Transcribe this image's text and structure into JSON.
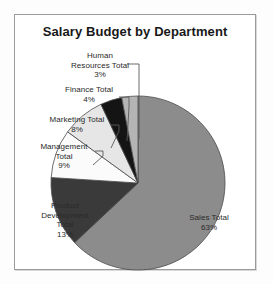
{
  "chart": {
    "title": "Salary Budget by Department",
    "frame_border_color": "#9a9a9a",
    "background_color": "#ffffff"
  },
  "chart_data": {
    "type": "pie",
    "title": "Salary Budget by Department",
    "xlabel": "",
    "ylabel": "",
    "units": "percent",
    "start_angle_deg": 0,
    "direction": "clockwise",
    "legend": "none",
    "grid": false,
    "categories": [
      "Sales Total",
      "Product Development Total",
      "Management Total",
      "Marketing Total",
      "Finance Total",
      "Human Resources Total"
    ],
    "values": [
      63,
      13,
      9,
      8,
      4,
      3
    ],
    "labels": [
      "Sales Total\n63%",
      "Product\nDevelopment\nTotal\n13%",
      "Management\nTotal\n9%",
      "Marketing Total\n8%",
      "Finance Total\n4%",
      "Human\nResources Total\n3%"
    ],
    "value_labels": [
      "63%",
      "13%",
      "9%",
      "8%",
      "4%",
      "3%"
    ],
    "colors": [
      "#8c8c8c",
      "#3a3a3a",
      "#fbfbfb",
      "#e6e6e6",
      "#141414",
      "#b4b4b4"
    ],
    "slice_outline_color": "#4a4a4a"
  }
}
